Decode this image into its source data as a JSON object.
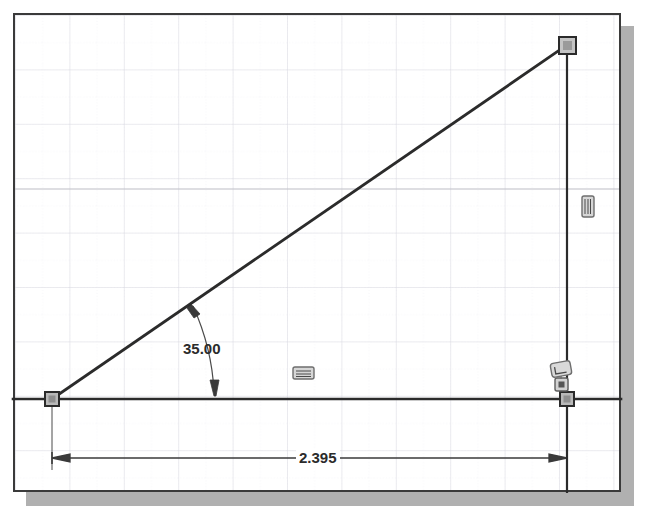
{
  "app": {
    "title": "2D Sketch View",
    "canvas_background": "#ffffff",
    "grid_minor_color": "#e8e8ee",
    "grid_major_color": "#d3d3db",
    "geometry_color": "#2b2b2b",
    "border_color": "#3a3a3a",
    "shadow_color": "#b0b0b0"
  },
  "sketch": {
    "name": "right-triangle-sketch",
    "entities": [
      {
        "name": "horizontal-line",
        "type": "line",
        "x1": 13,
        "y1": 399,
        "x2": 621,
        "y2": 399
      },
      {
        "name": "vertical-line",
        "type": "line",
        "x1": 567,
        "y1": 45,
        "x2": 567,
        "y2": 492
      },
      {
        "name": "inclined-line",
        "type": "line",
        "x1": 52,
        "y1": 399,
        "x2": 567,
        "y2": 45
      }
    ],
    "points": [
      {
        "name": "origin-point",
        "x": 52,
        "y": 399
      },
      {
        "name": "corner-point",
        "x": 567,
        "y": 399
      },
      {
        "name": "apex-point",
        "x": 567,
        "y": 45
      }
    ]
  },
  "dimensions": {
    "angle": {
      "label": "angle-dimension",
      "value": "35.00",
      "units": "degrees",
      "text_x": 183,
      "text_y": 340
    },
    "length": {
      "label": "horizontal-length-dimension",
      "value": "2.395",
      "units": "inches",
      "text_x": 296,
      "text_y": 449
    }
  },
  "constraints": [
    {
      "name": "horizontal-constraint",
      "icon": "horizontal-constraint-icon",
      "x": 300,
      "y": 371,
      "applies_to": "horizontal-line"
    },
    {
      "name": "vertical-constraint",
      "icon": "vertical-constraint-icon",
      "x": 588,
      "y": 206,
      "applies_to": "vertical-line"
    },
    {
      "name": "perpendicular-constraint",
      "icon": "perpendicular-constraint-icon",
      "x": 557,
      "y": 362,
      "applies_to": "corner-point"
    },
    {
      "name": "coincident-constraint",
      "icon": "coincident-constraint-icon",
      "x": 561,
      "y": 380,
      "applies_to": "corner-point"
    }
  ],
  "grid": {
    "minor_spacing": 27,
    "major_spacing": 55,
    "show_grid": true
  }
}
